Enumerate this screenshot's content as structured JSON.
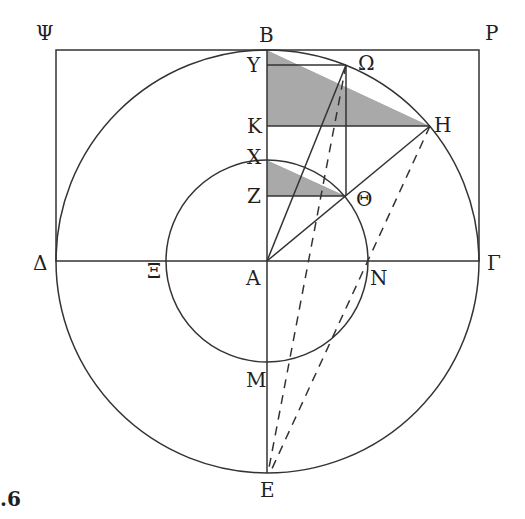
{
  "figure": {
    "caption_fragment": ".6",
    "center": {
      "x": 267,
      "y": 261
    },
    "outer_radius": 212,
    "inner_radius": 101,
    "colors": {
      "line": "#333333",
      "shade": "#a9a9a9",
      "background": "#ffffff"
    }
  },
  "labels": {
    "Psi": "Ψ",
    "B": "B",
    "P": "P",
    "Y": "Y",
    "Omega": "Ω",
    "K": "K",
    "H": "H",
    "X": "X",
    "Z": "Z",
    "Theta": "Θ",
    "Delta": "Δ",
    "Xi": "Ξ",
    "A": "A",
    "N": "N",
    "Gamma": "Γ",
    "M": "M",
    "E": "E"
  },
  "points": {
    "Psi": [
      56,
      50
    ],
    "B": [
      267,
      50
    ],
    "P": [
      481,
      50
    ],
    "Y": [
      267,
      65
    ],
    "Omega": [
      346,
      65
    ],
    "K": [
      267,
      126
    ],
    "H": [
      430,
      126
    ],
    "X": [
      267,
      160
    ],
    "Z": [
      267,
      196
    ],
    "Theta": [
      346,
      196
    ],
    "Delta": [
      55,
      261
    ],
    "Xi": [
      166,
      261
    ],
    "A": [
      267,
      261
    ],
    "N": [
      368,
      261
    ],
    "Gamma": [
      479,
      261
    ],
    "M": [
      267,
      362
    ],
    "E": [
      267,
      473
    ]
  }
}
